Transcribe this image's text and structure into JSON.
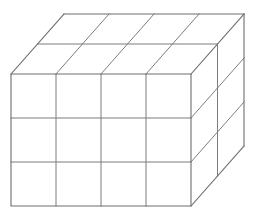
{
  "figure": {
    "background_color": "#ffffff",
    "line_color": "#6e6e6e",
    "inner_line_color": "#7d7d7d",
    "line_width": 1.1
  },
  "geometry": {
    "front_face": {
      "name": "front-face",
      "columns": 4,
      "rows": 3,
      "left_x": 11,
      "right_x": 191,
      "top_y": 74,
      "bottom_y": 206,
      "column_x": [
        11,
        56,
        101,
        146,
        191
      ],
      "row_y": [
        74,
        118,
        162,
        206
      ]
    },
    "depth": {
      "name": "depth-axis",
      "layers": 2,
      "dx": 53,
      "dy": -60,
      "step_dx": 26.5,
      "step_dy": -30
    },
    "top_face": {
      "name": "top-face",
      "columns": 4,
      "depth_rows": 2,
      "back_left_x": 64,
      "back_left_y": 14,
      "back_right_x": 244,
      "back_right_y": 14,
      "mid_left_x": 37.5,
      "mid_left_y": 44,
      "mid_right_x": 217.5,
      "mid_right_y": 44
    },
    "right_face": {
      "name": "right-face",
      "rows": 3,
      "depth_columns": 2,
      "front_top_x": 191,
      "front_top_y": 74,
      "back_top_x": 244,
      "back_top_y": 14,
      "back_bottom_x": 244,
      "back_bottom_y": 146,
      "mid_x": 217.5,
      "mid_top_y": 44
    },
    "counts": {
      "total_cubes": 24,
      "front_cells": 12,
      "top_cells": 8,
      "right_cells": 6
    }
  },
  "edges": {
    "front_outline": "M 11 74 L 191 74 L 191 206 L 11 206 Z",
    "front_vertical_1": "M 56 74 L 56 206",
    "front_vertical_2": "M 101 74 L 101 206",
    "front_vertical_3": "M 146 74 L 146 206",
    "front_horizontal_1": "M 11 118 L 191 118",
    "front_horizontal_2": "M 11 162 L 191 162",
    "top_back_edge": "M 64 14 L 244 14",
    "top_left_receding": "M 11 74 L 64 14",
    "top_right_receding": "M 191 74 L 244 14",
    "top_mid_depth_line": "M 37.5 44 L 217.5 44",
    "top_col_receding_1": "M 56 74 L 109 14",
    "top_col_receding_2": "M 101 74 L 154 14",
    "top_col_receding_3": "M 146 74 L 199 14",
    "right_back_vertical": "M 244 14 L 244 146",
    "right_mid_vertical": "M 217.5 44 L 217.5 176",
    "right_bottom_receding": "M 191 206 L 244 146",
    "right_row_receding_1": "M 191 118 L 244 58",
    "right_row_receding_2": "M 191 162 L 244 102"
  },
  "labels": {
    "visible_text": ""
  }
}
